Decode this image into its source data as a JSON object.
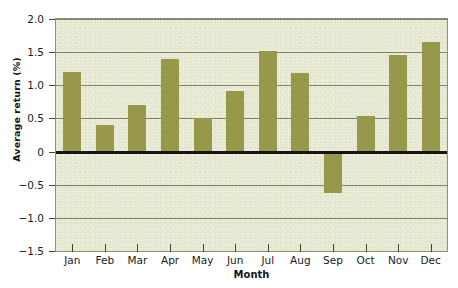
{
  "chart_data": {
    "type": "bar",
    "title": "",
    "xlabel": "Month",
    "ylabel": "Average return (%)",
    "categories": [
      "Jan",
      "Feb",
      "Mar",
      "Apr",
      "May",
      "Jun",
      "Jul",
      "Aug",
      "Sep",
      "Oct",
      "Nov",
      "Dec"
    ],
    "values": [
      1.2,
      0.4,
      0.7,
      1.4,
      0.5,
      0.92,
      1.52,
      1.18,
      -0.62,
      0.53,
      1.45,
      1.65
    ],
    "ylim": [
      -1.5,
      2.0
    ],
    "yticks": [
      2.0,
      1.5,
      1.0,
      0.5,
      0,
      -0.5,
      -1.0,
      -1.5
    ],
    "ytick_labels": [
      "2.0",
      "1.5",
      "1.0",
      "0.5",
      "0",
      "−0.5",
      "−1.0",
      "−1.5"
    ],
    "gridlines": [
      2.0,
      1.5,
      1.0,
      0.5,
      -0.5,
      -1.0
    ],
    "grid": true,
    "legend": null,
    "zero_line": 0,
    "colors": {
      "bar": "#97984a",
      "plot_background": "#e7e8d2",
      "gridline": "#7f826a",
      "zero_line": "#151515",
      "axis_text": "#1a1a1a",
      "page_background": "#ffffff"
    }
  }
}
